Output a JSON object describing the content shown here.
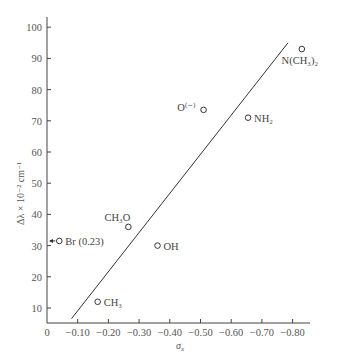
{
  "chart_data": {
    "type": "scatter",
    "title": "",
    "xlabel": "σx",
    "ylabel": "Δλ × 10⁻² cm⁻¹",
    "xlim": [
      0,
      -0.85
    ],
    "ylim": [
      5,
      103
    ],
    "grid": false,
    "legend": null,
    "x_ticks": [
      "0",
      "-0.10",
      "-0.20",
      "-0.30",
      "-0.40",
      "-0.50",
      "-0.60",
      "-0.70",
      "-0.80"
    ],
    "x_tick_values": [
      0,
      -0.1,
      -0.2,
      -0.3,
      -0.4,
      -0.5,
      -0.6,
      -0.7,
      -0.8
    ],
    "y_ticks": [
      "10",
      "20",
      "30",
      "40",
      "50",
      "60",
      "70",
      "80",
      "90",
      "100"
    ],
    "y_tick_values": [
      10,
      20,
      30,
      40,
      50,
      60,
      70,
      80,
      90,
      100
    ],
    "points": [
      {
        "label": "N(CH₃)₂",
        "x": -0.83,
        "y": 93,
        "label_pos": "below"
      },
      {
        "label": "O⁽⁻⁾",
        "x": -0.51,
        "y": 73.5,
        "label_pos": "left"
      },
      {
        "label": "NH₂",
        "x": -0.655,
        "y": 71,
        "label_pos": "right"
      },
      {
        "label": "CH₃O",
        "x": -0.265,
        "y": 36,
        "label_pos": "above-left"
      },
      {
        "label": "OH",
        "x": -0.36,
        "y": 30,
        "label_pos": "right"
      },
      {
        "label": "Br (0.23)",
        "x": -0.04,
        "y": 31.5,
        "label_pos": "right",
        "annotation": "arrow pointing left (off-scale, σ = 0.23)"
      },
      {
        "label": "CH₃",
        "x": -0.165,
        "y": 12,
        "label_pos": "right"
      }
    ],
    "fit_line": {
      "x": [
        -0.08,
        -0.785
      ],
      "y": [
        6.6,
        95
      ]
    }
  },
  "axes": {
    "x_title": "σ",
    "x_title_sub": "x",
    "y_title": "Δλ × 10⁻² cm⁻¹"
  }
}
